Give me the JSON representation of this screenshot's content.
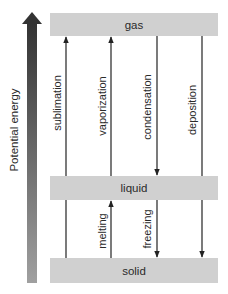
{
  "axis": {
    "label": "Potential energy",
    "direction": "up"
  },
  "states": {
    "gas": "gas",
    "liquid": "liquid",
    "solid": "solid"
  },
  "transitions": [
    {
      "label": "sublimation",
      "from": "solid",
      "to": "gas",
      "direction": "up"
    },
    {
      "label": "vaporization",
      "from": "liquid",
      "to": "gas",
      "direction": "up"
    },
    {
      "label": "condensation",
      "from": "gas",
      "to": "liquid",
      "direction": "down"
    },
    {
      "label": "deposition",
      "from": "gas",
      "to": "solid",
      "direction": "down"
    },
    {
      "label": "melting",
      "from": "solid",
      "to": "liquid",
      "direction": "up"
    },
    {
      "label": "freezing",
      "from": "liquid",
      "to": "solid",
      "direction": "down"
    }
  ],
  "colors": {
    "box_fill": "#d0d0d0",
    "arrow_line": "#222222",
    "energy_arrow_top": "#3a3a3a",
    "energy_arrow_bottom": "#9a9a9a"
  }
}
